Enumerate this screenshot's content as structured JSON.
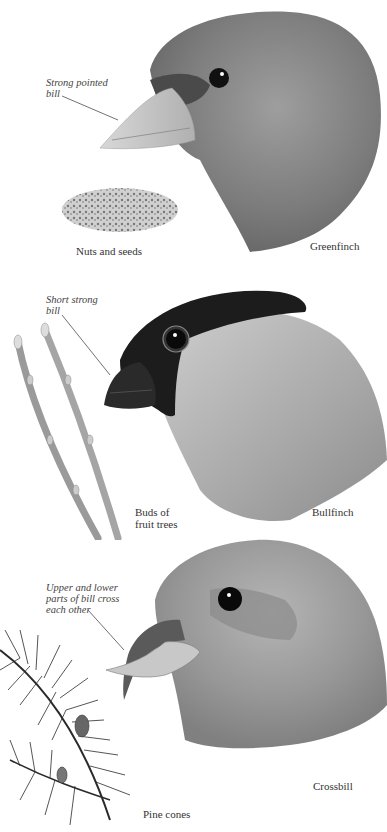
{
  "panels": [
    {
      "bird": "Greenfinch",
      "callout": [
        "Strong pointed",
        "bill"
      ],
      "food": [
        "Nuts and seeds"
      ]
    },
    {
      "bird": "Bullfinch",
      "callout": [
        "Short strong",
        "bill"
      ],
      "food": [
        "Buds of",
        "fruit trees"
      ]
    },
    {
      "bird": "Crossbill",
      "callout": [
        "Upper and lower",
        "parts of bill cross",
        "each other"
      ],
      "food": [
        "Pine cones"
      ]
    }
  ],
  "colors": {
    "background": "#ffffff",
    "greenfinch_plumage": "#8a8a8a",
    "bullfinch_cap": "#1a1a1a",
    "bullfinch_cheek": "#b5b5b5",
    "crossbill_plumage": "#9a9a9a",
    "text": "#333333"
  }
}
